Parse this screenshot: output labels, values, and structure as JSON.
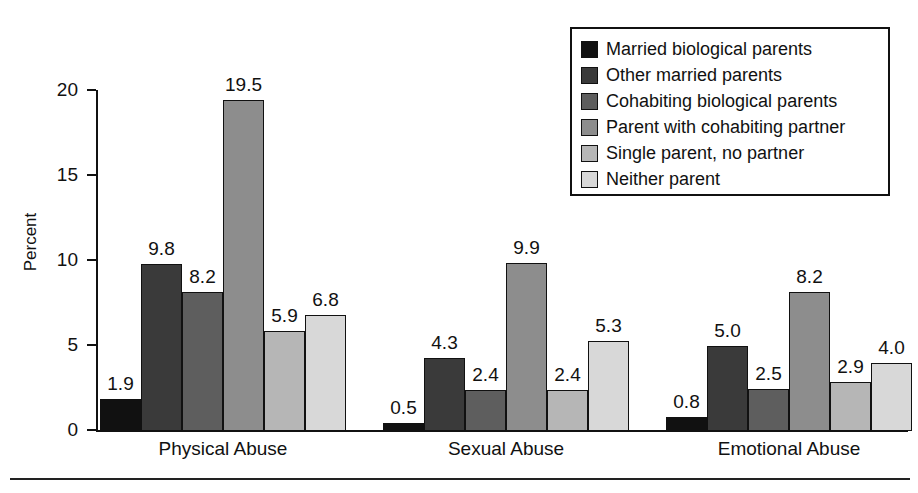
{
  "chart_data": {
    "type": "bar",
    "title": "",
    "xlabel": "",
    "ylabel": "Percent",
    "ylim": [
      0,
      20
    ],
    "yticks": [
      0,
      5,
      10,
      15,
      20
    ],
    "ytick_labels": [
      "0",
      "5",
      "10",
      "15",
      "20"
    ],
    "grid": false,
    "legend_position": "top-right",
    "categories": [
      "Physical Abuse",
      "Sexual Abuse",
      "Emotional Abuse"
    ],
    "series": [
      {
        "name": "Married biological parents",
        "color": "#111111",
        "values": [
          1.9,
          0.5,
          0.8
        ]
      },
      {
        "name": "Other married parents",
        "color": "#3a3a3a",
        "values": [
          9.8,
          4.3,
          5.0
        ]
      },
      {
        "name": "Cohabiting biological parents",
        "color": "#5e5e5e",
        "values": [
          8.2,
          2.4,
          2.5
        ]
      },
      {
        "name": "Parent with cohabiting partner",
        "color": "#8d8d8d",
        "values": [
          19.5,
          9.9,
          8.2
        ]
      },
      {
        "name": "Single parent, no partner",
        "color": "#b6b6b6",
        "values": [
          5.9,
          2.4,
          2.9
        ]
      },
      {
        "name": "Neither parent",
        "color": "#d8d8d8",
        "values": [
          6.8,
          5.3,
          4.0
        ]
      }
    ],
    "data_labels": [
      [
        "1.9",
        "9.8",
        "8.2",
        "19.5",
        "5.9",
        "6.8"
      ],
      [
        "0.5",
        "4.3",
        "2.4",
        "9.9",
        "2.4",
        "5.3"
      ],
      [
        "0.8",
        "5.0",
        "2.5",
        "8.2",
        "2.9",
        "4.0"
      ]
    ]
  },
  "axis": {
    "y_title": "Percent"
  },
  "legend": {
    "items": [
      {
        "label": "Married biological parents"
      },
      {
        "label": "Other married parents"
      },
      {
        "label": "Cohabiting biological parents"
      },
      {
        "label": "Parent with cohabiting partner"
      },
      {
        "label": "Single parent, no partner"
      },
      {
        "label": "Neither parent"
      }
    ]
  }
}
